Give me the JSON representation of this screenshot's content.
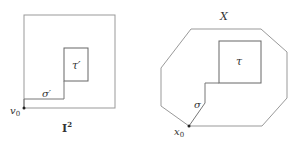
{
  "left_figure": {
    "outer_label": "I",
    "outer_label_sup": "2",
    "inner_label": "τ′",
    "path_label": "σ′",
    "basepoint_label": "v",
    "basepoint_sub": "0"
  },
  "right_figure": {
    "space_label": "X",
    "inner_label": "τ",
    "path_label": "σ",
    "basepoint_label": "x",
    "basepoint_sub": "0"
  },
  "colors": {
    "stroke": "#888888",
    "heavy_stroke": "#555555",
    "text": "#333333"
  }
}
